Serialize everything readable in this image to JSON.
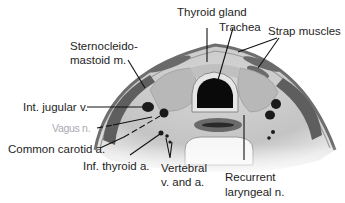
{
  "figure": {
    "colors": {
      "background": "#ffffff",
      "skin_outline": "#6e6e6e",
      "muscle": "#5e5e5e",
      "soft_tissue": "#c9c9c9",
      "tissue_light": "#dcdcdc",
      "trachea_lumen": "#0a0a0a",
      "vessel": "#1a1a1a",
      "leader_line": "#111111"
    }
  },
  "labels": {
    "thyroid_gland": "Thyroid gland",
    "trachea": "Trachea",
    "strap_muscles": "Strap muscles",
    "scm_line1": "Sternocleido-",
    "scm_line2": "mastoid m.",
    "int_jugular": "Int. jugular v.",
    "vagus": "Vagus n.",
    "common_carotid": "Common carotid a.",
    "inf_thyroid": "Inf. thyroid a.",
    "vertebral_line1": "Vertebral",
    "vertebral_line2": "v. and a.",
    "recurrent_line1": "Recurrent",
    "recurrent_line2": "laryngeal n."
  }
}
